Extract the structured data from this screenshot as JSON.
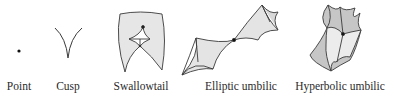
{
  "diagram": {
    "colors": {
      "stroke": "#3a3a3a",
      "fill_light": "#e8e8e8",
      "fill_mid": "#c8c8c8",
      "fill_dark": "#b0b0b0",
      "dot": "#111111"
    },
    "items": [
      {
        "label": "Point"
      },
      {
        "label": "Cusp"
      },
      {
        "label": "Swallowtail"
      },
      {
        "label": "Elliptic umbilic"
      },
      {
        "label": "Hyperbolic umbilic"
      }
    ]
  }
}
